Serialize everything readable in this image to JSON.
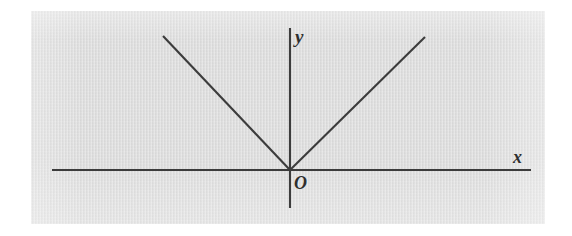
{
  "figure": {
    "kind": "coordinate-plane-diagram",
    "background_color": "#dcdcdc",
    "page_color": "#ffffff",
    "ink_color": "#3c3c3c",
    "labels": {
      "y_axis": "y",
      "x_axis": "x",
      "origin": "O"
    },
    "panel": {
      "left": 31,
      "top": 11,
      "width": 514,
      "height": 213
    },
    "axes": {
      "x_axis": {
        "x1": 52,
        "y1": 170,
        "x2": 531,
        "y2": 170
      },
      "y_axis": {
        "x1": 290,
        "y1": 28,
        "x2": 290,
        "y2": 208
      },
      "origin": {
        "x": 290,
        "y": 170
      }
    },
    "graph": {
      "type": "absolute-value",
      "vertex": {
        "x": 290,
        "y": 170
      },
      "left_arm": {
        "x1": 163,
        "y1": 36,
        "x2": 290,
        "y2": 170
      },
      "right_arm": {
        "x1": 290,
        "y1": 170,
        "x2": 425,
        "y2": 37
      }
    }
  },
  "chart_data": {
    "type": "line",
    "title": "",
    "xlabel": "x",
    "ylabel": "y",
    "grid": false,
    "legend": null,
    "annotations": [
      "O"
    ],
    "series": [
      {
        "name": "y = a|x|",
        "points": [
          {
            "x": -1.0,
            "y": 1.05
          },
          {
            "x": 0.0,
            "y": 0.0
          },
          {
            "x": 1.06,
            "y": 1.04
          }
        ]
      }
    ],
    "xlim": [
      -1.87,
      1.89
    ],
    "ylim": [
      -0.3,
      1.11
    ]
  }
}
